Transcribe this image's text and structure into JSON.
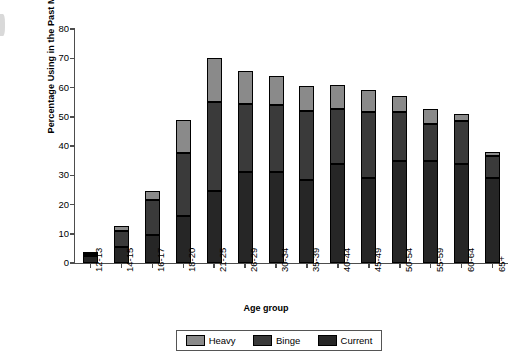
{
  "chart_data": {
    "type": "bar",
    "subtype": "stacked",
    "title": "",
    "xlabel": "Age group",
    "ylabel": "Percentage Using in the Past Month",
    "ylim": [
      0,
      80
    ],
    "yticks": [
      0,
      10,
      20,
      30,
      40,
      50,
      60,
      70,
      80
    ],
    "grid": false,
    "legend_position": "bottom",
    "categories": [
      "12-13",
      "14-15",
      "16-17",
      "18-20",
      "21-25",
      "26-29",
      "30-34",
      "35-39",
      "40-44",
      "45-49",
      "50-54",
      "55-59",
      "60-64",
      "65+"
    ],
    "series": [
      {
        "name": "Current",
        "color": "#262626",
        "values": [
          2.5,
          5.5,
          9.5,
          16,
          24.5,
          31,
          31,
          28.5,
          34,
          29,
          35,
          35,
          34,
          29
        ]
      },
      {
        "name": "Binge",
        "color": "#3a3a3a",
        "values": [
          0.6,
          5.5,
          12,
          21.5,
          30.5,
          23.5,
          23,
          23.5,
          18.5,
          22.5,
          16.5,
          12.5,
          14.5,
          7.5
        ]
      },
      {
        "name": "Heavy",
        "color": "#8a8a8a",
        "values": [
          0.4,
          1.5,
          3,
          11.5,
          15,
          11,
          10,
          8.5,
          8.5,
          7.5,
          5.5,
          5,
          2.5,
          1.5
        ]
      }
    ],
    "totals": [
      3.5,
      12.5,
      24.5,
      49,
      70,
      65.5,
      64,
      60.5,
      61,
      59,
      57,
      52.5,
      51,
      38
    ],
    "legend": [
      "Heavy",
      "Binge",
      "Current"
    ]
  },
  "legend": {
    "items": [
      {
        "label": "Heavy",
        "key": "heavy"
      },
      {
        "label": "Binge",
        "key": "binge"
      },
      {
        "label": "Current",
        "key": "current"
      }
    ]
  },
  "axes": {
    "y_title": "Percentage Using in the Past Month",
    "x_title": "Age group"
  }
}
